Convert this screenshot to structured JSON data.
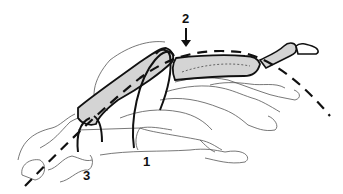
{
  "diagram": {
    "type": "anatomical-illustration",
    "labels": [
      {
        "id": "1",
        "text": "1",
        "x": 146,
        "y": 158
      },
      {
        "id": "2",
        "text": "2",
        "x": 181,
        "y": 10
      },
      {
        "id": "3",
        "text": "3",
        "x": 85,
        "y": 172
      }
    ],
    "elements": {
      "arrow": "downward arrow under label 2 pointing to joint",
      "shaded_bones": "highlighted metacarpal and proximal phalanx (grey fill)",
      "wires": "curved dark lines (pins) crossing the metacarpal",
      "axis_line": "long dashed line along the ray axis"
    },
    "colors": {
      "outline": "#111111",
      "bone_fill": "#d4d4d4",
      "faint_outline": "#555555",
      "background": "#ffffff"
    }
  }
}
